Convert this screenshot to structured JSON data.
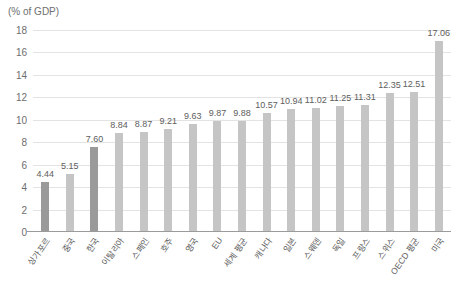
{
  "chart_data": {
    "type": "bar",
    "title": "",
    "subtitle": "",
    "axis_note": "(% of GDP)",
    "xlabel": "",
    "ylabel": "(% of GDP)",
    "ylim": [
      0,
      18
    ],
    "ytick_step": 2,
    "yticks": [
      "18",
      "16",
      "14",
      "12",
      "10",
      "8",
      "6",
      "4",
      "2",
      "0"
    ],
    "grid": true,
    "legend": "none",
    "categories": [
      "싱가포르",
      "중국",
      "한국",
      "이탈리아",
      "스페인",
      "호주",
      "영국",
      "EU",
      "세계 평균",
      "캐나다",
      "일본",
      "스웨덴",
      "독일",
      "프랑스",
      "스위스",
      "OECD 평균",
      "미국"
    ],
    "values": [
      4.44,
      5.15,
      7.6,
      8.84,
      8.87,
      9.21,
      9.63,
      9.87,
      9.88,
      10.57,
      10.94,
      11.02,
      11.25,
      11.31,
      12.35,
      12.51,
      17.06
    ],
    "value_labels": [
      "4.44",
      "5.15",
      "7.60",
      "8.84",
      "8.87",
      "9.21",
      "9.63",
      "9.87",
      "9.88",
      "10.57",
      "10.94",
      "11.02",
      "11.25",
      "11.31",
      "12.35",
      "12.51",
      "17.06"
    ],
    "highlighted": [
      true,
      false,
      true,
      false,
      false,
      false,
      false,
      false,
      false,
      false,
      false,
      false,
      false,
      false,
      false,
      false,
      false
    ],
    "colors": {
      "bar": "#c5c5c5",
      "bar_highlight": "#9a9a9a",
      "grid": "#e3e3e3",
      "axis": "#9b9b9b",
      "text": "#5d5d5d",
      "tick_text": "#6e6e6e",
      "background": "#ffffff"
    }
  }
}
